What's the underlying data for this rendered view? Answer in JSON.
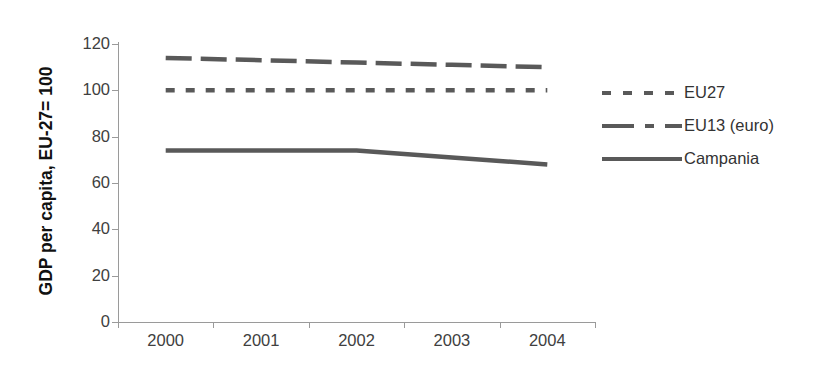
{
  "chart_data": {
    "type": "line",
    "title": "",
    "xlabel": "",
    "ylabel": "GDP per capita, EU-27= 100",
    "categories": [
      "2000",
      "2001",
      "2002",
      "2003",
      "2004"
    ],
    "ylim": [
      0,
      120
    ],
    "yticks": [
      0,
      20,
      40,
      60,
      80,
      100,
      120
    ],
    "grid": false,
    "legend_position": "right",
    "series": [
      {
        "name": "EU27",
        "linestyle": "dotted",
        "color": "#595959",
        "values": [
          100,
          100,
          100,
          100,
          100
        ]
      },
      {
        "name": "EU13 (euro)",
        "linestyle": "dashed",
        "color": "#595959",
        "values": [
          114,
          113,
          112,
          111,
          110
        ]
      },
      {
        "name": "Campania",
        "linestyle": "solid",
        "color": "#595959",
        "values": [
          74,
          74,
          74,
          71,
          68
        ]
      }
    ]
  },
  "axis": {
    "y_title": "GDP per capita, EU-27= 100",
    "y_tick_labels": [
      "120",
      "100",
      "80",
      "60",
      "40",
      "20",
      "0"
    ],
    "x_tick_labels": [
      "2000",
      "2001",
      "2002",
      "2003",
      "2004"
    ]
  },
  "legend": {
    "entries": [
      {
        "label": "EU27",
        "key": "dotted-line-key"
      },
      {
        "label": "EU13 (euro)",
        "key": "dashed-line-key"
      },
      {
        "label": "Campania",
        "key": "solid-line-key"
      }
    ]
  }
}
